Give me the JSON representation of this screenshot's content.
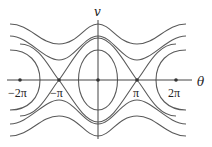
{
  "diagram": {
    "type": "phase-portrait",
    "axes": {
      "x_label": "θ",
      "y_label": "v"
    },
    "tick_labels": {
      "neg_two_pi": "−2π",
      "neg_pi": "−π",
      "pi": "π",
      "two_pi": "2π"
    },
    "equilibria": [
      "-2π",
      "-π",
      "0",
      "π",
      "2π"
    ],
    "curve_color": "#555555",
    "axis_color": "#444444"
  }
}
